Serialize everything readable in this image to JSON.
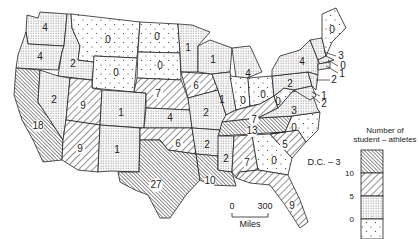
{
  "legend": {
    "title_line1": "Number of",
    "title_line2": "student – athletes",
    "ticks": [
      "10",
      "5",
      "0"
    ],
    "bins": [
      {
        "range": ">10",
        "pattern": "dense-hatch"
      },
      {
        "range": "5-10",
        "pattern": "wide-hatch"
      },
      {
        "range": "1-5",
        "pattern": "dense-dots"
      },
      {
        "range": "0",
        "pattern": "sparse-dots"
      }
    ]
  },
  "scale": {
    "start": "0",
    "end": "300",
    "unit": "Miles"
  },
  "dc_label": "D.C. – 3",
  "states": {
    "WA": "4",
    "OR": "4",
    "CA": "18",
    "ID": "2",
    "NV": "2",
    "MT": "0",
    "WY": "0",
    "UT": "9",
    "AZ": "9",
    "CO": "1",
    "NM": "1",
    "ND": "0",
    "SD": "0",
    "NE": "7",
    "KS": "4",
    "OK": "6",
    "TX": "27",
    "MN": "1",
    "IA": "6",
    "MO": "2",
    "AR": "2",
    "LA": "10",
    "WI": "1",
    "IL": "1",
    "MI": "4",
    "IN": "0",
    "OH": "0",
    "KY": "7",
    "TN": "13",
    "MS": "2",
    "AL": "7",
    "GA": "0",
    "FL": "9",
    "SC": "5",
    "NC": "0",
    "VA": "3",
    "WV": "0",
    "PA": "2",
    "NY": "4",
    "ME": "0",
    "NH": "3",
    "MA": "0",
    "RI": "1",
    "NJ": "2",
    "DE": "1",
    "MD": "2"
  }
}
